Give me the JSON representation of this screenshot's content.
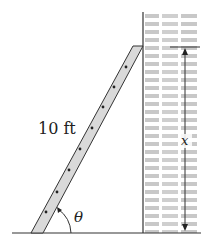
{
  "diagram": {
    "ladder_length_label": "10 ft",
    "angle_label": "θ",
    "height_label": "x",
    "colors": {
      "line": "#333333",
      "ladder_fill": "#d9d9d9",
      "brick_text": "#bdbdbd",
      "background": "#ffffff"
    }
  }
}
